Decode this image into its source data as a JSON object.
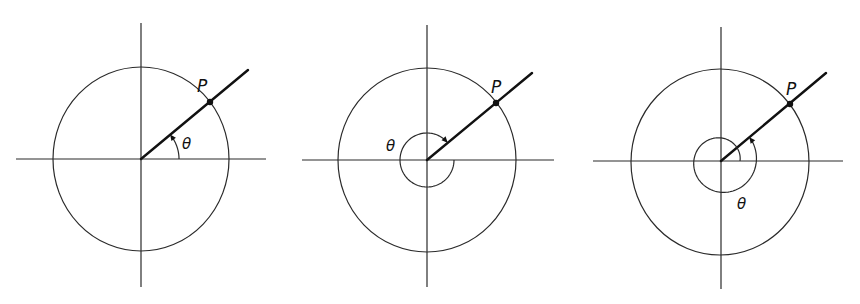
{
  "figure": {
    "point_label": "P",
    "angle_label": "θ",
    "line_color": "#2a2a2a",
    "ray_color": "#111111",
    "panels": [
      {
        "id": "panel-1",
        "angle_kind": "positive-acute",
        "ray_angle_deg": 40,
        "theta_deg": 40,
        "direction": "counterclockwise",
        "point_label": "P",
        "angle_label": "θ"
      },
      {
        "id": "panel-2",
        "angle_kind": "negative",
        "ray_angle_deg": 40,
        "theta_deg": -320,
        "direction": "clockwise",
        "point_label": "P",
        "angle_label": "θ"
      },
      {
        "id": "panel-3",
        "angle_kind": "positive-more-than-one-revolution",
        "ray_angle_deg": 40,
        "theta_deg": 400,
        "direction": "counterclockwise",
        "point_label": "P",
        "angle_label": "θ"
      }
    ]
  }
}
